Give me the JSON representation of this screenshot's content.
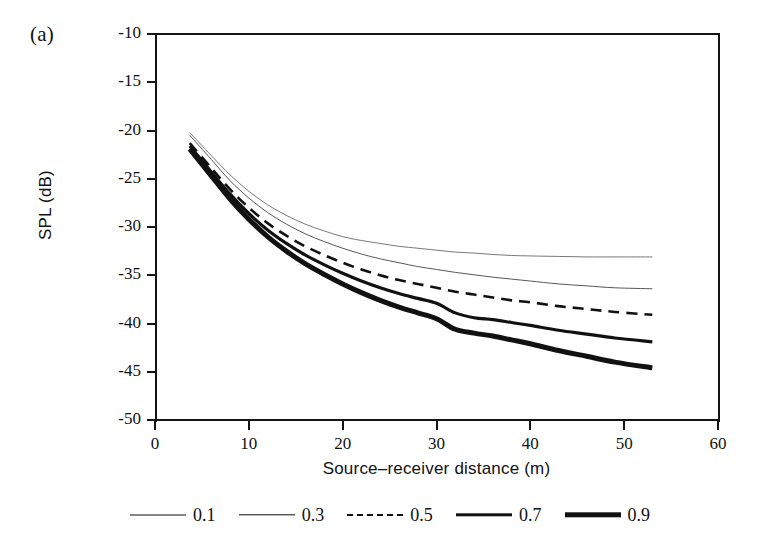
{
  "figure": {
    "panel_label": "(a)"
  },
  "chart_data": {
    "type": "line",
    "title": "",
    "panel": "(a)",
    "xlabel": "Source–receiver distance (m)",
    "ylabel": "SPL (dB)",
    "xlim": [
      0,
      60
    ],
    "ylim": [
      -50,
      -10
    ],
    "xticks": [
      0,
      10,
      20,
      30,
      40,
      50,
      60
    ],
    "yticks": [
      -10,
      -15,
      -20,
      -25,
      -30,
      -35,
      -40,
      -45,
      -50
    ],
    "xtick_labels": [
      "0",
      "10",
      "20",
      "30",
      "40",
      "50",
      "60"
    ],
    "ytick_labels": [
      "-10",
      "-15",
      "-20",
      "-25",
      "-30",
      "-35",
      "-40",
      "-45",
      "-50"
    ],
    "grid": false,
    "legend_position": "below-axes",
    "legend_title": "",
    "x": [
      3.7,
      6,
      8,
      10,
      12,
      14,
      16,
      18,
      20,
      22,
      24,
      26,
      28,
      30,
      32,
      34,
      36,
      38,
      40,
      43,
      46,
      49,
      53
    ],
    "series": [
      {
        "name": "0.1",
        "label": "0.1",
        "style": "solid",
        "linewidth": 0.8,
        "color": "#555555",
        "values": [
          -20.2,
          -22.6,
          -24.6,
          -26.3,
          -27.7,
          -28.8,
          -29.7,
          -30.4,
          -31.0,
          -31.4,
          -31.7,
          -32.0,
          -32.2,
          -32.4,
          -32.6,
          -32.7,
          -32.85,
          -32.95,
          -33.0,
          -33.05,
          -33.1,
          -33.1,
          -33.1
        ]
      },
      {
        "name": "0.3",
        "label": "0.3",
        "style": "solid",
        "linewidth": 0.9,
        "color": "#444444",
        "values": [
          -20.5,
          -23.0,
          -25.2,
          -27.0,
          -28.5,
          -29.7,
          -30.7,
          -31.5,
          -32.2,
          -32.8,
          -33.3,
          -33.7,
          -34.1,
          -34.4,
          -34.7,
          -34.95,
          -35.2,
          -35.4,
          -35.6,
          -35.9,
          -36.1,
          -36.3,
          -36.4
        ]
      },
      {
        "name": "0.5",
        "label": "0.5",
        "style": "dashed",
        "linewidth": 2.6,
        "color": "#111111",
        "values": [
          -21.3,
          -23.9,
          -26.1,
          -28.0,
          -29.6,
          -30.9,
          -32.0,
          -32.9,
          -33.7,
          -34.4,
          -35.0,
          -35.5,
          -35.9,
          -36.3,
          -36.7,
          -37.0,
          -37.3,
          -37.6,
          -37.8,
          -38.2,
          -38.5,
          -38.8,
          -39.1
        ]
      },
      {
        "name": "0.7",
        "label": "0.7",
        "style": "solid",
        "linewidth": 3.2,
        "color": "#111111",
        "values": [
          -21.6,
          -24.3,
          -26.6,
          -28.6,
          -30.3,
          -31.7,
          -32.9,
          -33.9,
          -34.8,
          -35.6,
          -36.3,
          -36.9,
          -37.4,
          -37.9,
          -38.9,
          -39.4,
          -39.6,
          -39.9,
          -40.2,
          -40.7,
          -41.1,
          -41.5,
          -41.9
        ]
      },
      {
        "name": "0.9",
        "label": "0.9",
        "style": "solid",
        "linewidth": 5.0,
        "color": "#111111",
        "values": [
          -21.9,
          -24.7,
          -27.1,
          -29.2,
          -31.0,
          -32.5,
          -33.8,
          -34.9,
          -35.9,
          -36.8,
          -37.6,
          -38.3,
          -38.9,
          -39.5,
          -40.6,
          -41.0,
          -41.3,
          -41.7,
          -42.1,
          -42.8,
          -43.4,
          -44.0,
          -44.6
        ]
      }
    ]
  },
  "legend": {
    "entries": [
      {
        "label": "0.1",
        "style": "solid",
        "linewidth": 1
      },
      {
        "label": "0.3",
        "style": "solid",
        "linewidth": 1.4
      },
      {
        "label": "0.5",
        "style": "dashed",
        "linewidth": 2.6
      },
      {
        "label": "0.7",
        "style": "solid",
        "linewidth": 3.4
      },
      {
        "label": "0.9",
        "style": "solid",
        "linewidth": 5.4
      }
    ]
  }
}
